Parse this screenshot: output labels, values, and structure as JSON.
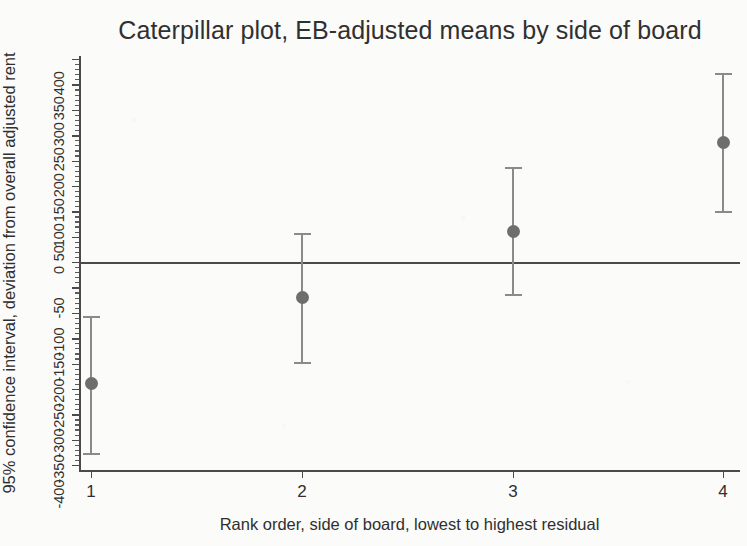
{
  "chart_data": {
    "type": "scatter",
    "title": "Caterpillar plot, EB-adjusted means by side of board",
    "xlabel": "Rank order, side of board, lowest to highest residual",
    "ylabel": "95% confidence interval, deviation from overall adjusted rent",
    "grid": false,
    "legend": null,
    "xlim": [
      0.6,
      4.4
    ],
    "ylim": [
      -420,
      420
    ],
    "x_tick_labels": [
      "1",
      "2",
      "3",
      "4"
    ],
    "x": [
      1,
      2,
      3,
      4
    ],
    "y_tick_labels": [
      "-400",
      "-350",
      "-300",
      "-250",
      "-200",
      "-150",
      "-100",
      "-50",
      "0",
      "50",
      "100",
      "150",
      "200",
      "250",
      "300",
      "350",
      "400"
    ],
    "y_ticks": [
      -400,
      -350,
      -300,
      -250,
      -200,
      -150,
      -100,
      -50,
      0,
      50,
      100,
      150,
      200,
      250,
      300,
      350,
      400
    ],
    "series": [
      {
        "name": "EB-adjusted mean deviation",
        "values": [
          -240,
          -69,
          61,
          236
        ],
        "ci_lower": [
          -376,
          -197,
          -63,
          100
        ],
        "ci_upper": [
          -106,
          57,
          187,
          372
        ]
      }
    ],
    "reference_line": 0,
    "marker_color": "#6e6e6e",
    "ci_color": "#8a8a8a",
    "axis_color": "#4a4a4a",
    "background_color": "#fbfbfa"
  }
}
